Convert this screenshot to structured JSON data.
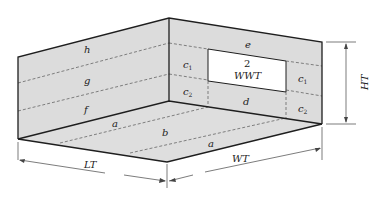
{
  "diagram": {
    "type": "room-surface-partition",
    "colors": {
      "surface_fill": "#dcdcdc",
      "edge": "#1e1e1e",
      "dashed": "#555555",
      "window_fill": "#ffffff"
    },
    "window": {
      "count_label": "2",
      "label": "WWT"
    },
    "left_wall_regions": {
      "top": "h",
      "middle": "g",
      "bottom": "f"
    },
    "back_wall_regions": {
      "top": "e",
      "left_upper": "c",
      "left_upper_sub": "1",
      "left_lower": "c",
      "left_lower_sub": "2",
      "right_upper": "c",
      "right_upper_sub": "1",
      "right_lower": "c",
      "right_lower_sub": "2",
      "below_window": "d"
    },
    "floor_regions": {
      "left_strip": "a",
      "center": "b",
      "right_strip": "a"
    },
    "dimensions": {
      "length": "LT",
      "width": "WT",
      "height": "HT"
    }
  }
}
